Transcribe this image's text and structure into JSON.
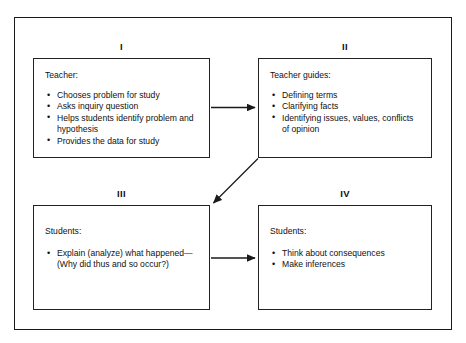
{
  "diagram": {
    "frame_color": "#1a1a1a",
    "box_border_color": "#222222",
    "background_color": "#ffffff",
    "text_color": "#111111",
    "quadrants": [
      {
        "numeral": "I",
        "heading": "Teacher:",
        "items": [
          "Chooses problem for study",
          "Asks inquiry question",
          "Helps students identify problem and hypothesis",
          "Provides the data for study"
        ]
      },
      {
        "numeral": "II",
        "heading": "Teacher guides:",
        "items": [
          "Defining terms",
          "Clarifying facts",
          "Identifying issues, values, conflicts of opinion"
        ]
      },
      {
        "numeral": "III",
        "heading": "Students:",
        "items": [
          "Explain (analyze) what happened—(Why did thus and so occur?)"
        ]
      },
      {
        "numeral": "IV",
        "heading": "Students:",
        "items": [
          "Think about consequences",
          "Make inferences"
        ]
      }
    ],
    "arrows": [
      {
        "name": "arrow-i-to-ii",
        "from": "I",
        "to": "II",
        "direction": "horizontal-right"
      },
      {
        "name": "arrow-ii-to-iii",
        "from": "II",
        "to": "III",
        "direction": "diagonal-down-left"
      },
      {
        "name": "arrow-iii-to-iv",
        "from": "III",
        "to": "IV",
        "direction": "horizontal-right"
      }
    ]
  }
}
